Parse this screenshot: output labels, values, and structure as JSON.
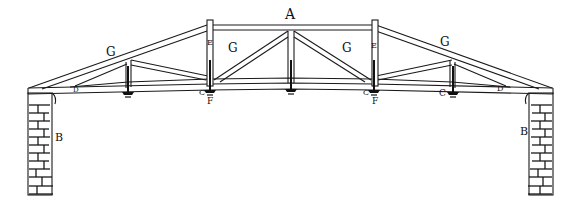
{
  "figure": {
    "type": "roof truss elevation drawing",
    "labels": {
      "top_chord": "A",
      "wall_left": "B",
      "wall_right": "B",
      "rafter_left": "G",
      "rafter_right": "G",
      "panel_left": "G",
      "panel_right": "G",
      "post_left": "E",
      "post_right": "E",
      "joint_left": "C",
      "joint_right": "C",
      "joint_far_right": "C",
      "hanger_left": "F",
      "hanger_right": "F",
      "heel_left": "D",
      "heel_right": "D"
    },
    "colors": {
      "ink": "#1a1a1a",
      "paper": "#ffffff"
    }
  }
}
